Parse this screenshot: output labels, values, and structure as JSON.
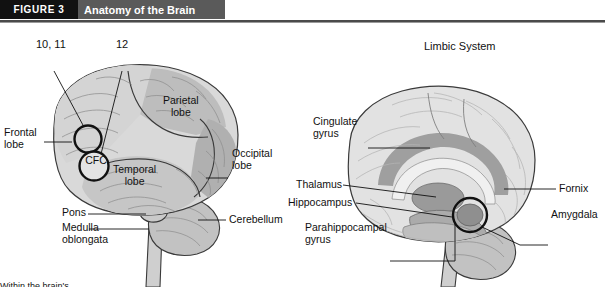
{
  "figure": {
    "tag": "FIGURE 3",
    "title": "Anatomy of the Brain"
  },
  "colors": {
    "tag_bg": "#111111",
    "title_bg": "#5a5a5a",
    "rule": "#4a4a4a",
    "brain_light": "#d9d9d9",
    "brain_mid": "#c2c2c2",
    "brain_dark": "#ababab",
    "outline": "#3a3a3a",
    "leader": "#111111",
    "background": "#ffffff"
  },
  "left_diagram": {
    "name": "lateral-brain-view",
    "callouts": [
      {
        "id": "ten-eleven",
        "text": "10, 11"
      },
      {
        "id": "twelve",
        "text": "12"
      },
      {
        "id": "cfc",
        "text": "CFC"
      }
    ],
    "labels": [
      {
        "id": "frontal-lobe",
        "text": "Frontal\nlobe"
      },
      {
        "id": "parietal-lobe",
        "text": "Parietal\nlobe"
      },
      {
        "id": "temporal-lobe",
        "text": "Temporal\nlobe"
      },
      {
        "id": "occipital-lobe",
        "text": "Occipital\nlobe"
      },
      {
        "id": "pons",
        "text": "Pons"
      },
      {
        "id": "medulla-oblongata",
        "text": "Medulla\noblongata"
      },
      {
        "id": "cerebellum",
        "text": "Cerebellum"
      }
    ]
  },
  "right_diagram": {
    "name": "limbic-system-view",
    "title": "Limbic System",
    "labels": [
      {
        "id": "cingulate-gyrus",
        "text": "Cingulate\ngyrus"
      },
      {
        "id": "thalamus",
        "text": "Thalamus"
      },
      {
        "id": "hippocampus",
        "text": "Hippocampus"
      },
      {
        "id": "parahippocampal-gyrus",
        "text": "Parahippocampal\ngyrus"
      },
      {
        "id": "fornix",
        "text": "Fornix"
      },
      {
        "id": "amygdala",
        "text": "Amygdala"
      }
    ]
  },
  "caption": {
    "text": "Within the brain's..."
  }
}
